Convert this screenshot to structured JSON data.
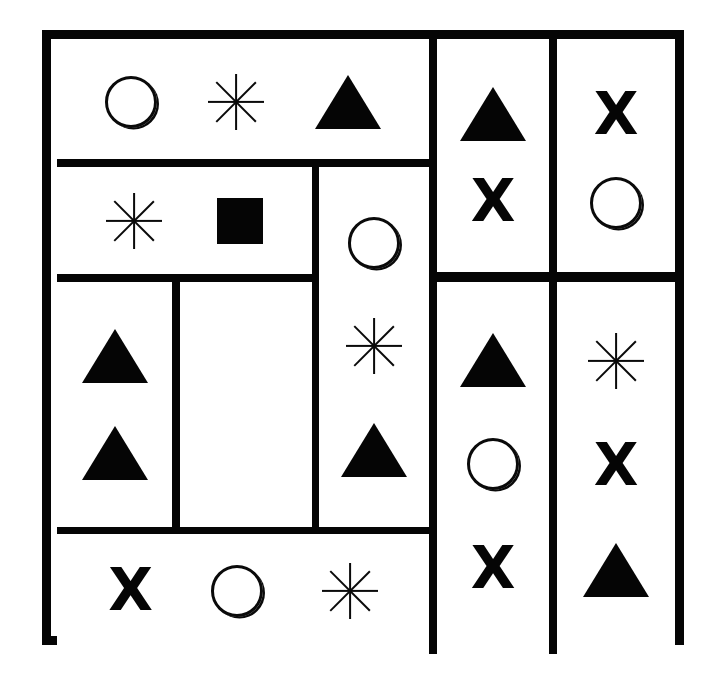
{
  "figure": {
    "background_color": "#ffffff",
    "ink_color": "#050505",
    "border_thickness_px": 9,
    "frame": {
      "x": 42,
      "y": 30,
      "width": 642,
      "height": 615
    }
  },
  "symbol_legend": [
    {
      "key": "circle",
      "name": "circle-outline-symbol",
      "glyph": "○"
    },
    {
      "key": "asterisk",
      "name": "eight-ray-asterisk-symbol",
      "glyph": "✳"
    },
    {
      "key": "triangle",
      "name": "filled-triangle-symbol",
      "glyph": "▲"
    },
    {
      "key": "square",
      "name": "filled-square-symbol",
      "glyph": "■"
    },
    {
      "key": "ex",
      "name": "bold-x-symbol",
      "glyph": "X"
    }
  ],
  "cells": [
    {
      "id": "cell-top-wide",
      "label": "top wide band",
      "orientation": "row",
      "rect": {
        "left": 6,
        "top": 5,
        "width": 372,
        "height": 115
      },
      "symbols": [
        "circle",
        "asterisk",
        "triangle"
      ]
    },
    {
      "id": "cell-second-left",
      "label": "second row left band",
      "orientation": "row",
      "rect": {
        "left": 6,
        "top": 128,
        "width": 255,
        "height": 107
      },
      "symbols": [
        "asterisk",
        "square"
      ]
    },
    {
      "id": "cell-middle-tall",
      "label": "tall centre column",
      "orientation": "col",
      "rect": {
        "left": 268,
        "top": 128,
        "width": 110,
        "height": 360
      },
      "symbols": [
        "circle",
        "asterisk",
        "triangle"
      ]
    },
    {
      "id": "cell-left-narrow",
      "label": "left narrow column",
      "orientation": "col",
      "rect": {
        "left": 6,
        "top": 243,
        "width": 115,
        "height": 245
      },
      "symbols": [
        "triangle",
        "triangle"
      ]
    },
    {
      "id": "cell-empty-middle",
      "label": "empty compartment",
      "orientation": "col",
      "rect": {
        "left": 129,
        "top": 243,
        "width": 132,
        "height": 245
      },
      "symbols": []
    },
    {
      "id": "cell-bottom-wide",
      "label": "bottom wide band",
      "orientation": "row",
      "rect": {
        "left": 6,
        "top": 495,
        "width": 372,
        "height": 114
      },
      "symbols": [
        "ex",
        "circle",
        "asterisk"
      ]
    },
    {
      "id": "cell-right-a-top",
      "label": "right column A upper",
      "orientation": "col",
      "rect": {
        "left": 386,
        "top": 5,
        "width": 112,
        "height": 228
      },
      "symbols": [
        "triangle",
        "ex"
      ]
    },
    {
      "id": "cell-right-b-top",
      "label": "right column B upper",
      "orientation": "col",
      "rect": {
        "left": 506,
        "top": 5,
        "width": 118,
        "height": 228
      },
      "symbols": [
        "ex",
        "circle"
      ]
    },
    {
      "id": "cell-right-a-bottom",
      "label": "right column A lower",
      "orientation": "col",
      "rect": {
        "left": 386,
        "top": 243,
        "width": 112,
        "height": 366
      },
      "symbols": [
        "triangle",
        "circle",
        "ex"
      ]
    },
    {
      "id": "cell-right-b-bottom",
      "label": "right column B lower",
      "orientation": "col",
      "rect": {
        "left": 506,
        "top": 243,
        "width": 118,
        "height": 366
      },
      "symbols": [
        "asterisk",
        "ex",
        "triangle"
      ]
    }
  ],
  "dividers": [
    {
      "id": "div-h-1",
      "kind": "horizontal",
      "rect": {
        "left": 6,
        "top": 120,
        "width": 372,
        "height": 8
      }
    },
    {
      "id": "div-h-2",
      "kind": "horizontal",
      "rect": {
        "left": 6,
        "top": 235,
        "width": 255,
        "height": 8
      }
    },
    {
      "id": "div-h-3",
      "kind": "horizontal",
      "rect": {
        "left": 6,
        "top": 488,
        "width": 372,
        "height": 8
      }
    },
    {
      "id": "div-h-4",
      "kind": "horizontal",
      "rect": {
        "left": 386,
        "top": 233,
        "width": 238,
        "height": 10
      }
    },
    {
      "id": "div-v-1",
      "kind": "vertical",
      "rect": {
        "left": 121,
        "top": 243,
        "width": 8,
        "height": 245
      }
    },
    {
      "id": "div-v-2",
      "kind": "vertical",
      "rect": {
        "left": 261,
        "top": 128,
        "width": 7,
        "height": 360
      }
    },
    {
      "id": "div-v-3",
      "kind": "vertical",
      "rect": {
        "left": 378,
        "top": 0,
        "width": 8,
        "height": 615
      }
    },
    {
      "id": "div-v-4",
      "kind": "vertical",
      "rect": {
        "left": 498,
        "top": 0,
        "width": 8,
        "height": 615
      }
    }
  ]
}
